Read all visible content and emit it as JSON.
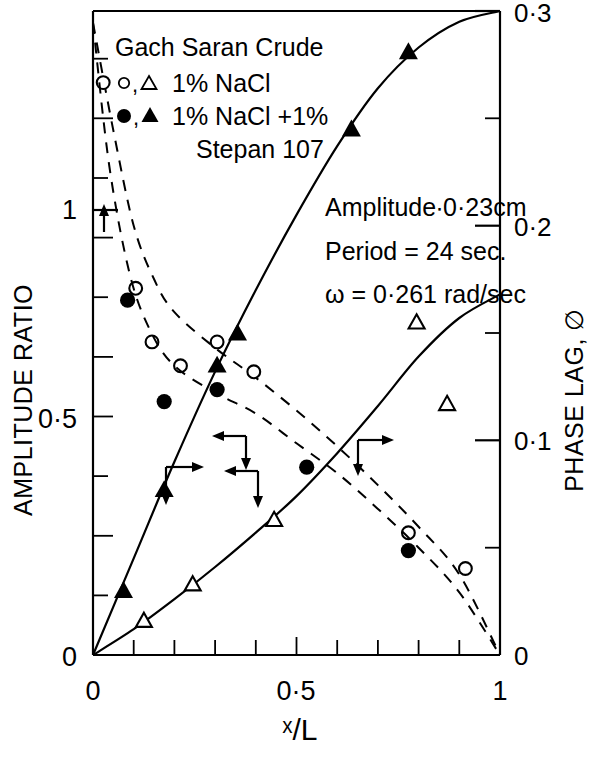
{
  "figure": {
    "legend": {
      "title": "Gach Saran Crude",
      "entries": [
        {
          "markers": "o,△",
          "label": "1%  NaCl"
        },
        {
          "markers": "●,▲",
          "label": "1% NaCl +1%"
        },
        {
          "markers": "",
          "label": "Stepan 107"
        }
      ]
    },
    "annotations": [
      "Amplitude∙0·23cm",
      "Period = 24 sec.",
      "ω = 0·261 rad/sec"
    ],
    "axes": {
      "x": {
        "label": "ˣ/L",
        "ticks": [
          {
            "value": 0,
            "label": "0"
          },
          {
            "value": 0.1,
            "label": ""
          },
          {
            "value": 0.2,
            "label": ""
          },
          {
            "value": 0.3,
            "label": ""
          },
          {
            "value": 0.4,
            "label": ""
          },
          {
            "value": 0.5,
            "label": "0·5"
          },
          {
            "value": 0.6,
            "label": ""
          },
          {
            "value": 0.7,
            "label": ""
          },
          {
            "value": 0.8,
            "label": ""
          },
          {
            "value": 0.9,
            "label": ""
          },
          {
            "value": 1.0,
            "label": "1"
          }
        ],
        "min": 0,
        "max": 1
      },
      "y_left": {
        "label": "AMPLITUDE  RATIO",
        "ticks": [
          {
            "value": 0,
            "label": "0"
          },
          {
            "value": 0.1,
            "label": ""
          },
          {
            "value": 0.2,
            "label": ""
          },
          {
            "value": 0.3,
            "label": ""
          },
          {
            "value": 0.4,
            "label": ""
          },
          {
            "value": 0.5,
            "label": "0·5"
          },
          {
            "value": 0.6,
            "label": ""
          },
          {
            "value": 0.7,
            "label": ""
          },
          {
            "value": 0.8,
            "label": ""
          },
          {
            "value": 0.9,
            "label": ""
          },
          {
            "value": 1.0,
            "label": "1"
          }
        ],
        "min": 0,
        "max": 1.08
      },
      "y_right": {
        "label": "PHASE  LAG,  ∅",
        "ticks": [
          {
            "value": 0,
            "label": "0"
          },
          {
            "value": 0.05,
            "label": ""
          },
          {
            "value": 0.1,
            "label": "0·1"
          },
          {
            "value": 0.15,
            "label": ""
          },
          {
            "value": 0.2,
            "label": "0·2"
          },
          {
            "value": 0.25,
            "label": ""
          },
          {
            "value": 0.3,
            "label": "0·3"
          }
        ],
        "min": 0,
        "max": 0.3
      }
    }
  },
  "chart_data": {
    "type": "scatter",
    "title": "Gach Saran Crude",
    "xlabel": "ˣ/L",
    "ylabel": "AMPLITUDE  RATIO",
    "ylabel_right": "PHASE  LAG,  ∅",
    "xlim": [
      0,
      1
    ],
    "ylim_left": [
      0,
      1.08
    ],
    "ylim_right": [
      0,
      0.3
    ],
    "grid": false,
    "legend_position": "upper-left",
    "series": [
      {
        "name": "1% NaCl — amplitude ratio",
        "axis": "left",
        "marker": "open-circle",
        "line": "dashed",
        "curve": [
          {
            "x": 0.0,
            "y": 1.06
          },
          {
            "x": 0.05,
            "y": 0.88
          },
          {
            "x": 0.1,
            "y": 0.72
          },
          {
            "x": 0.15,
            "y": 0.63
          },
          {
            "x": 0.2,
            "y": 0.575
          },
          {
            "x": 0.3,
            "y": 0.515
          },
          {
            "x": 0.4,
            "y": 0.465
          },
          {
            "x": 0.5,
            "y": 0.41
          },
          {
            "x": 0.6,
            "y": 0.35
          },
          {
            "x": 0.7,
            "y": 0.285
          },
          {
            "x": 0.8,
            "y": 0.215
          },
          {
            "x": 0.9,
            "y": 0.135
          },
          {
            "x": 1.0,
            "y": 0.0
          }
        ],
        "points": [
          {
            "x": 0.025,
            "y": 0.96
          },
          {
            "x": 0.105,
            "y": 0.615
          },
          {
            "x": 0.145,
            "y": 0.525
          },
          {
            "x": 0.215,
            "y": 0.485
          },
          {
            "x": 0.305,
            "y": 0.525
          },
          {
            "x": 0.395,
            "y": 0.475
          },
          {
            "x": 0.775,
            "y": 0.205
          },
          {
            "x": 0.915,
            "y": 0.145
          }
        ]
      },
      {
        "name": "1% NaCl +1% Stepan 107 — amplitude ratio",
        "axis": "left",
        "marker": "filled-circle",
        "line": "dashed",
        "curve": [
          {
            "x": 0.0,
            "y": 1.06
          },
          {
            "x": 0.04,
            "y": 0.82
          },
          {
            "x": 0.09,
            "y": 0.64
          },
          {
            "x": 0.14,
            "y": 0.545
          },
          {
            "x": 0.2,
            "y": 0.485
          },
          {
            "x": 0.3,
            "y": 0.44
          },
          {
            "x": 0.4,
            "y": 0.405
          },
          {
            "x": 0.5,
            "y": 0.355
          },
          {
            "x": 0.6,
            "y": 0.305
          },
          {
            "x": 0.7,
            "y": 0.245
          },
          {
            "x": 0.8,
            "y": 0.18
          },
          {
            "x": 0.9,
            "y": 0.105
          },
          {
            "x": 1.0,
            "y": 0.0
          }
        ],
        "points": [
          {
            "x": 0.085,
            "y": 0.595
          },
          {
            "x": 0.175,
            "y": 0.425
          },
          {
            "x": 0.305,
            "y": 0.445
          },
          {
            "x": 0.525,
            "y": 0.315
          },
          {
            "x": 0.775,
            "y": 0.175
          }
        ]
      },
      {
        "name": "1% NaCl +1% Stepan 107 — phase lag",
        "axis": "right",
        "marker": "filled-triangle",
        "line": "solid",
        "curve": [
          {
            "x": 0.0,
            "y": 0.0
          },
          {
            "x": 0.1,
            "y": 0.045
          },
          {
            "x": 0.2,
            "y": 0.09
          },
          {
            "x": 0.3,
            "y": 0.132
          },
          {
            "x": 0.4,
            "y": 0.17
          },
          {
            "x": 0.5,
            "y": 0.205
          },
          {
            "x": 0.6,
            "y": 0.237
          },
          {
            "x": 0.7,
            "y": 0.264
          },
          {
            "x": 0.8,
            "y": 0.283
          },
          {
            "x": 0.9,
            "y": 0.295
          },
          {
            "x": 1.0,
            "y": 0.3
          }
        ],
        "points": [
          {
            "x": 0.075,
            "y": 0.03
          },
          {
            "x": 0.175,
            "y": 0.077
          },
          {
            "x": 0.305,
            "y": 0.135
          },
          {
            "x": 0.355,
            "y": 0.15
          },
          {
            "x": 0.635,
            "y": 0.245
          },
          {
            "x": 0.775,
            "y": 0.281
          }
        ]
      },
      {
        "name": "1% NaCl — phase lag",
        "axis": "right",
        "marker": "open-triangle",
        "line": "solid",
        "curve": [
          {
            "x": 0.0,
            "y": 0.0
          },
          {
            "x": 0.1,
            "y": 0.012
          },
          {
            "x": 0.2,
            "y": 0.026
          },
          {
            "x": 0.3,
            "y": 0.041
          },
          {
            "x": 0.4,
            "y": 0.057
          },
          {
            "x": 0.5,
            "y": 0.074
          },
          {
            "x": 0.6,
            "y": 0.094
          },
          {
            "x": 0.7,
            "y": 0.116
          },
          {
            "x": 0.8,
            "y": 0.139
          },
          {
            "x": 0.9,
            "y": 0.157
          },
          {
            "x": 1.0,
            "y": 0.168
          }
        ],
        "points": [
          {
            "x": 0.125,
            "y": 0.016
          },
          {
            "x": 0.245,
            "y": 0.033
          },
          {
            "x": 0.445,
            "y": 0.063
          },
          {
            "x": 0.795,
            "y": 0.155
          },
          {
            "x": 0.87,
            "y": 0.117
          }
        ]
      }
    ],
    "annotations": [
      {
        "text": "Amplitude∙0·23cm"
      },
      {
        "text": "Period = 24 sec."
      },
      {
        "text": "ω = 0·261 rad/sec"
      }
    ]
  }
}
